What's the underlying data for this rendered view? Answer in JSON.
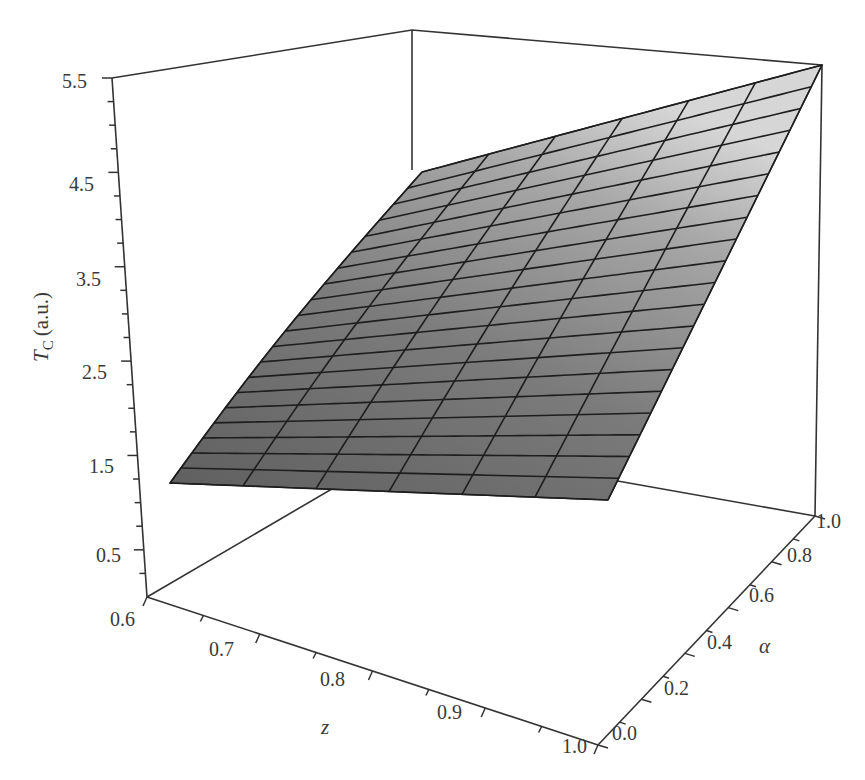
{
  "chart_data": {
    "type": "surface3d",
    "title": "",
    "xlabel": "z",
    "ylabel": "α",
    "zlabel": "T_C (a.u.)",
    "zlabel_main": "T",
    "zlabel_sub": "C",
    "zlabel_unit": "(a.u.)",
    "x_axis": {
      "name": "z",
      "range": [
        0.6,
        1.0
      ],
      "ticks": [
        "0.6",
        "0.7",
        "0.8",
        "0.9",
        "1.0"
      ]
    },
    "y_axis": {
      "name": "α",
      "range": [
        0.0,
        1.0
      ],
      "ticks": [
        "0.0",
        "0.2",
        "0.4",
        "0.6",
        "0.8",
        "1.0"
      ]
    },
    "z_axis": {
      "name": "T_C (a.u.)",
      "range": [
        0.0,
        5.5
      ],
      "ticks": [
        "0.5",
        "1.5",
        "2.5",
        "3.5",
        "4.5",
        "5.5"
      ]
    },
    "surface": {
      "grid_z_lines": 7,
      "grid_alpha_lines": 21,
      "corner_values": [
        {
          "z": 0.6,
          "alpha": 0.0,
          "Tc": 1.3
        },
        {
          "z": 1.0,
          "alpha": 0.0,
          "Tc": 1.3
        },
        {
          "z": 0.6,
          "alpha": 1.0,
          "Tc": 4.7
        },
        {
          "z": 1.0,
          "alpha": 1.0,
          "Tc": 5.5
        }
      ],
      "shading": "grayscale, darker at low α, lighter at high α"
    },
    "grid": false,
    "legend": null
  }
}
